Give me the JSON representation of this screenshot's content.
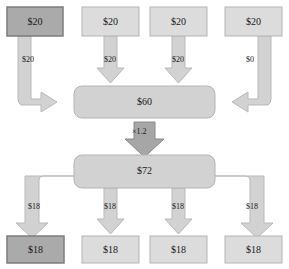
{
  "diagram": {
    "background": "#ffffff",
    "palette": {
      "node_fill": "#dcdcdc",
      "node_stroke": "#b4b4b4",
      "highlight_fill": "#aaaaaa",
      "highlight_stroke": "#7d7d7d",
      "flow_fill": "#d2d2d2",
      "flow_stroke": "#b9b9b9",
      "accent_fill": "#a6a6a6",
      "accent_stroke": "#8a8a8a",
      "text": "#1a1a1a"
    },
    "top_nodes": [
      {
        "id": "src-1",
        "label": "$20",
        "highlighted": true
      },
      {
        "id": "src-2",
        "label": "$20",
        "highlighted": false
      },
      {
        "id": "src-3",
        "label": "$20",
        "highlighted": false
      },
      {
        "id": "src-4",
        "label": "$20",
        "highlighted": false
      }
    ],
    "inflow_labels": [
      {
        "id": "inflow-1",
        "label": "$20"
      },
      {
        "id": "inflow-2",
        "label": "$20"
      },
      {
        "id": "inflow-3",
        "label": "$20"
      },
      {
        "id": "inflow-4",
        "label": "$0"
      }
    ],
    "pool_in": {
      "id": "pool-in",
      "label": "$60"
    },
    "multiplier": {
      "id": "multiplier",
      "label": "×1.2"
    },
    "pool_out": {
      "id": "pool-out",
      "label": "$72"
    },
    "outflow_labels": [
      {
        "id": "outflow-1",
        "label": "$18"
      },
      {
        "id": "outflow-2",
        "label": "$18"
      },
      {
        "id": "outflow-3",
        "label": "$18"
      },
      {
        "id": "outflow-4",
        "label": "$18"
      }
    ],
    "bottom_nodes": [
      {
        "id": "dst-1",
        "label": "$18",
        "highlighted": true
      },
      {
        "id": "dst-2",
        "label": "$18",
        "highlighted": false
      },
      {
        "id": "dst-3",
        "label": "$18",
        "highlighted": false
      },
      {
        "id": "dst-4",
        "label": "$18",
        "highlighted": false
      }
    ]
  }
}
